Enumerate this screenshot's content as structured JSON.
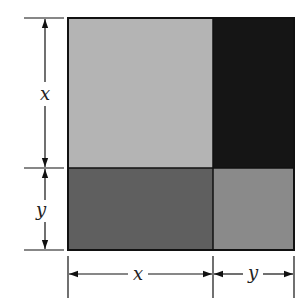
{
  "diagram": {
    "labels": {
      "left_top": "x",
      "left_bottom": "y",
      "bottom_left": "x",
      "bottom_right": "y"
    },
    "regions": [
      {
        "name": "x-by-x",
        "color": "#b4b4b4"
      },
      {
        "name": "x-by-y-top-right",
        "color": "#151515"
      },
      {
        "name": "y-by-x-bottom-left",
        "color": "#5f5f5f"
      },
      {
        "name": "y-by-y",
        "color": "#8a8a8a"
      }
    ],
    "colors": {
      "border": "#111111",
      "arrow": "#111111"
    }
  }
}
